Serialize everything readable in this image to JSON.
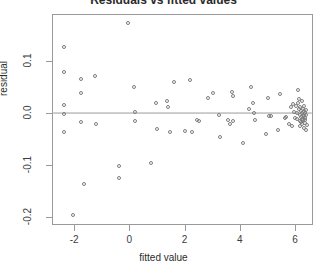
{
  "chart_data": {
    "type": "scatter",
    "title": "Residuals vs fitted values",
    "xlabel": "fitted value",
    "ylabel": "residual",
    "xlim": [
      -2.8,
      6.65
    ],
    "ylim": [
      -0.215,
      0.19
    ],
    "xticks": [
      -2,
      0,
      2,
      4,
      6
    ],
    "xtick_labels": [
      "-2",
      "0",
      "2",
      "4",
      "6"
    ],
    "yticks": [
      0.1,
      0.0,
      -0.1,
      -0.2
    ],
    "ytick_labels": [
      "0.1",
      "0.0",
      "-0.1",
      "-0.2"
    ],
    "grid": false,
    "legend": null,
    "reference_lines": [
      {
        "orientation": "horizontal",
        "y": 0.0,
        "color": "#9a9a9a"
      }
    ],
    "marker": {
      "shape": "circle-open",
      "color": "#7d7d7d",
      "size_px": 4
    },
    "series": [
      {
        "name": "residuals",
        "points": [
          [
            -2.42,
            0.129
          ],
          [
            -2.42,
            0.081
          ],
          [
            -2.42,
            0.018
          ],
          [
            -2.42,
            0.0
          ],
          [
            -2.42,
            -0.034
          ],
          [
            -2.08,
            -0.194
          ],
          [
            -1.8,
            0.067
          ],
          [
            -1.8,
            0.04
          ],
          [
            -1.78,
            -0.015
          ],
          [
            -1.66,
            -0.135
          ],
          [
            -1.29,
            0.072
          ],
          [
            -1.26,
            -0.019
          ],
          [
            -0.42,
            -0.1
          ],
          [
            -0.4,
            -0.122
          ],
          [
            -0.1,
            0.175
          ],
          [
            0.13,
            0.051
          ],
          [
            0.16,
            0.003
          ],
          [
            0.18,
            -0.013
          ],
          [
            0.74,
            -0.094
          ],
          [
            0.92,
            0.022
          ],
          [
            0.97,
            -0.029
          ],
          [
            1.34,
            0.024
          ],
          [
            1.37,
            0.014
          ],
          [
            1.44,
            -0.034
          ],
          [
            1.58,
            0.062
          ],
          [
            1.97,
            -0.032
          ],
          [
            2.17,
            0.066
          ],
          [
            2.22,
            -0.035
          ],
          [
            2.4,
            -0.011
          ],
          [
            2.48,
            -0.013
          ],
          [
            2.82,
            0.03
          ],
          [
            2.98,
            0.04
          ],
          [
            3.22,
            -0.001
          ],
          [
            3.25,
            -0.045
          ],
          [
            3.52,
            -0.012
          ],
          [
            3.6,
            -0.019
          ],
          [
            3.68,
            0.043
          ],
          [
            3.7,
            0.034
          ],
          [
            3.72,
            -0.014
          ],
          [
            4.08,
            -0.055
          ],
          [
            4.3,
            0.01
          ],
          [
            4.36,
            0.051
          ],
          [
            4.43,
            0.021
          ],
          [
            4.46,
            0.001
          ],
          [
            4.5,
            -0.011
          ],
          [
            4.92,
            -0.039
          ],
          [
            4.99,
            0.03
          ],
          [
            5.02,
            -0.003
          ],
          [
            5.08,
            -0.003
          ],
          [
            5.34,
            -0.031
          ],
          [
            5.42,
            0.039
          ],
          [
            5.6,
            -0.008
          ],
          [
            5.64,
            -0.005
          ],
          [
            5.74,
            -0.02
          ],
          [
            5.8,
            0.013
          ],
          [
            5.86,
            -0.024
          ],
          [
            5.9,
            0.019
          ],
          [
            5.94,
            0.004
          ],
          [
            5.96,
            -0.008
          ],
          [
            6.0,
            0.016
          ],
          [
            6.02,
            0.001
          ],
          [
            6.04,
            -0.01
          ],
          [
            6.06,
            0.022
          ],
          [
            6.08,
            0.047
          ],
          [
            6.1,
            0.028
          ],
          [
            6.12,
            0.009
          ],
          [
            6.13,
            -0.002
          ],
          [
            6.14,
            -0.013
          ],
          [
            6.15,
            -0.024
          ],
          [
            6.16,
            0.013
          ],
          [
            6.17,
            0.005
          ],
          [
            6.18,
            -0.005
          ],
          [
            6.19,
            -0.016
          ],
          [
            6.2,
            0.024
          ],
          [
            6.21,
            0.002
          ],
          [
            6.22,
            -0.009
          ],
          [
            6.23,
            -0.02
          ],
          [
            6.24,
            0.01
          ],
          [
            6.25,
            -0.001
          ],
          [
            6.26,
            -0.012
          ],
          [
            6.27,
            0.006
          ],
          [
            6.28,
            -0.004
          ],
          [
            6.29,
            -0.026
          ],
          [
            6.3,
            0.016
          ],
          [
            6.31,
            -0.007
          ],
          [
            6.32,
            -0.017
          ],
          [
            6.33,
            0.001
          ],
          [
            6.34,
            -0.011
          ],
          [
            6.35,
            -0.031
          ],
          [
            6.36,
            0.008
          ],
          [
            6.37,
            -0.002
          ],
          [
            6.38,
            -0.021
          ]
        ]
      }
    ]
  }
}
